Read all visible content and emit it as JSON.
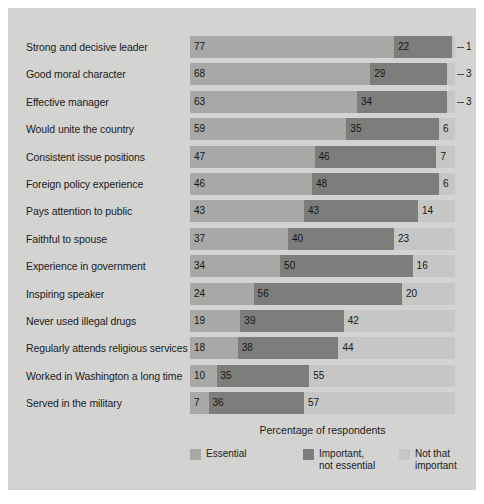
{
  "chart_data": {
    "type": "bar",
    "orientation": "horizontal",
    "stacked": true,
    "title": "",
    "xlabel": "Percentage of respondents",
    "ylabel": "",
    "xlim": [
      0,
      100
    ],
    "grid": false,
    "legend_position": "bottom",
    "categories": [
      "Strong and decisive leader",
      "Good moral character",
      "Effective manager",
      "Would unite the country",
      "Consistent issue positions",
      "Foreign policy experience",
      "Pays attention to public",
      "Faithful to spouse",
      "Experience in government",
      "Inspiring speaker",
      "Never used illegal drugs",
      "Regularly attends religious services",
      "Worked in Washington a long time",
      "Served in the military"
    ],
    "series": [
      {
        "name": "Essential",
        "color": "#a8a8a6",
        "values": [
          77,
          68,
          63,
          59,
          47,
          46,
          43,
          37,
          34,
          24,
          19,
          18,
          10,
          7
        ]
      },
      {
        "name": "Important, not essential",
        "color": "#7d7d7b",
        "values": [
          22,
          29,
          34,
          35,
          46,
          48,
          43,
          40,
          50,
          56,
          39,
          38,
          35,
          36
        ]
      },
      {
        "name": "Not that important",
        "color": "#c6c6c4",
        "values": [
          1,
          3,
          3,
          6,
          7,
          6,
          14,
          23,
          16,
          20,
          42,
          44,
          55,
          57
        ]
      }
    ],
    "callout_rows": [
      0,
      1,
      2
    ]
  },
  "legend": [
    {
      "label": "Essential",
      "color": "#a8a8a6"
    },
    {
      "label": "Important,\nnot essential",
      "color": "#7d7d7b"
    },
    {
      "label": "Not that\nimportant",
      "color": "#c6c6c4"
    }
  ],
  "axis": {
    "title": "Percentage of respondents"
  },
  "colors": {
    "panel_background": "#d3d3d2",
    "page_background": "#ffffff",
    "essential": "#a8a8a6",
    "important": "#7d7d7b",
    "not_that_important": "#c6c6c4",
    "text": "#1b1b1b"
  }
}
